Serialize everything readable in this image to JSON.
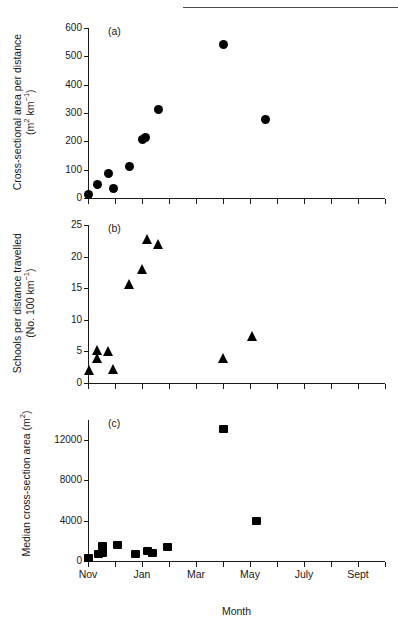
{
  "figure": {
    "header_ghost_left": "",
    "header_ghost_right": "",
    "panels": [
      {
        "tag": "(a)",
        "ylabel_line1": "Cross-sectional area per distance",
        "ylabel_line2": "(m2 km-1)",
        "yticks": [
          "0",
          "100",
          "200",
          "300",
          "400",
          "500",
          "600"
        ]
      },
      {
        "tag": "(b)",
        "ylabel_line1": "Schools per distance travelled",
        "ylabel_line2": "(No. 100 km-1)",
        "yticks": [
          "0",
          "5",
          "10",
          "15",
          "20",
          "25"
        ]
      },
      {
        "tag": "(c)",
        "ylabel_line1": "Median cross-section area (m2)",
        "ylabel_line2": "",
        "yticks": [
          "0",
          "4000",
          "8000",
          "12000"
        ]
      }
    ],
    "xlabel": "Month",
    "xticklabels": [
      "Nov",
      "Jan",
      "Mar",
      "May",
      "July",
      "Sept"
    ],
    "marker_color": "#000000",
    "axis_color": "#1a1a1a"
  },
  "chart_data": [
    {
      "type": "scatter",
      "panel": "(a)",
      "title": "",
      "xlabel": "Month",
      "ylabel": "Cross-sectional area per distance (m² km⁻¹)",
      "ylim": [
        0,
        600
      ],
      "yticks": [
        0,
        100,
        200,
        300,
        400,
        500,
        600
      ],
      "xlim": [
        "Nov",
        "Oct"
      ],
      "xtick_months": [
        "Nov",
        "Dec",
        "Jan",
        "Feb",
        "Mar",
        "Apr",
        "May",
        "June",
        "July",
        "Aug",
        "Sept",
        "Oct"
      ],
      "grid": false,
      "legend": "none",
      "marker": "circle",
      "points": [
        {
          "x_month": "Nov",
          "x_frac": 0.0,
          "y": 12
        },
        {
          "x_month": "Nov/Dec",
          "x_frac": 0.35,
          "y": 48
        },
        {
          "x_month": "Dec",
          "x_frac": 0.75,
          "y": 86
        },
        {
          "x_month": "Dec/Jan",
          "x_frac": 0.95,
          "y": 34
        },
        {
          "x_month": "Jan/Feb",
          "x_frac": 1.55,
          "y": 112
        },
        {
          "x_month": "Feb",
          "x_frac": 2.0,
          "y": 205
        },
        {
          "x_month": "Feb",
          "x_frac": 2.12,
          "y": 213
        },
        {
          "x_month": "Mar",
          "x_frac": 2.62,
          "y": 311
        },
        {
          "x_month": "July",
          "x_frac": 5.0,
          "y": 541
        },
        {
          "x_month": "Sept",
          "x_frac": 6.57,
          "y": 279
        }
      ]
    },
    {
      "type": "scatter",
      "panel": "(b)",
      "title": "",
      "xlabel": "Month",
      "ylabel": "Schools per distance travelled (No. 100 km⁻¹)",
      "ylim": [
        0,
        25
      ],
      "yticks": [
        0,
        5,
        10,
        15,
        20,
        25
      ],
      "grid": false,
      "legend": "none",
      "marker": "triangle",
      "points": [
        {
          "x_month": "Nov",
          "x_frac": 0.05,
          "y": 2.0
        },
        {
          "x_month": "Nov/Dec",
          "x_frac": 0.35,
          "y": 5.2
        },
        {
          "x_month": "Nov/Dec",
          "x_frac": 0.35,
          "y": 3.9
        },
        {
          "x_month": "Dec",
          "x_frac": 0.77,
          "y": 5.0
        },
        {
          "x_month": "Dec/Jan",
          "x_frac": 0.95,
          "y": 2.2
        },
        {
          "x_month": "Jan/Feb",
          "x_frac": 1.55,
          "y": 15.6
        },
        {
          "x_month": "Feb",
          "x_frac": 2.0,
          "y": 17.9
        },
        {
          "x_month": "Feb",
          "x_frac": 2.2,
          "y": 22.7
        },
        {
          "x_month": "Mar",
          "x_frac": 2.62,
          "y": 22.0
        },
        {
          "x_month": "July",
          "x_frac": 5.0,
          "y": 3.9
        },
        {
          "x_month": "Sept",
          "x_frac": 6.1,
          "y": 7.4
        }
      ]
    },
    {
      "type": "scatter",
      "panel": "(c)",
      "title": "",
      "xlabel": "Month",
      "ylabel": "Median cross-section area (m²)",
      "ylim": [
        0,
        14000
      ],
      "yticks": [
        0,
        4000,
        8000,
        12000
      ],
      "grid": false,
      "legend": "none",
      "marker": "square",
      "points": [
        {
          "x_month": "Nov",
          "x_frac": 0.0,
          "y": 300
        },
        {
          "x_month": "Nov/Dec",
          "x_frac": 0.38,
          "y": 700
        },
        {
          "x_month": "Dec",
          "x_frac": 0.55,
          "y": 1500
        },
        {
          "x_month": "Dec",
          "x_frac": 0.55,
          "y": 800
        },
        {
          "x_month": "Jan",
          "x_frac": 1.1,
          "y": 1600
        },
        {
          "x_month": "Feb",
          "x_frac": 1.75,
          "y": 700
        },
        {
          "x_month": "Feb/Mar",
          "x_frac": 2.22,
          "y": 1000
        },
        {
          "x_month": "Mar",
          "x_frac": 2.38,
          "y": 750
        },
        {
          "x_month": "Mar/Apr",
          "x_frac": 2.95,
          "y": 1350
        },
        {
          "x_month": "July",
          "x_frac": 5.0,
          "y": 13100
        },
        {
          "x_month": "Sept",
          "x_frac": 6.25,
          "y": 3950
        }
      ]
    }
  ]
}
